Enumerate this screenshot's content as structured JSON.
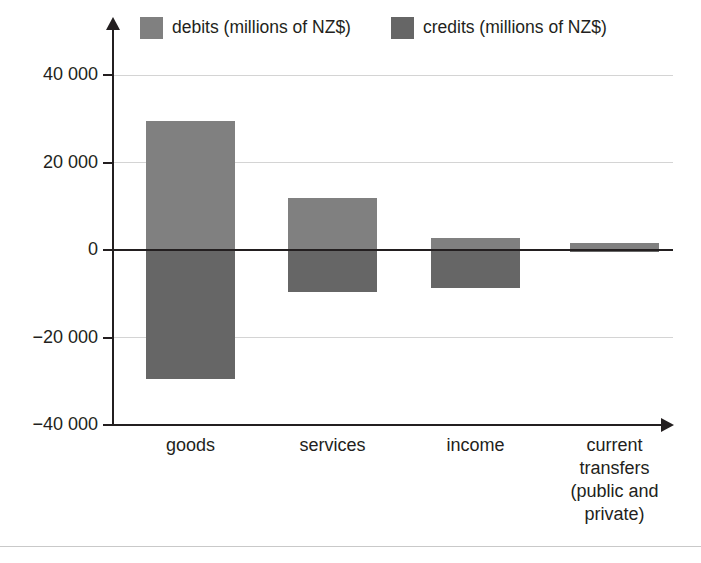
{
  "chart_data": {
    "type": "bar",
    "title": "",
    "subtitle": "",
    "xlabel": "",
    "ylabel": "",
    "ylim": [
      -40000,
      40000
    ],
    "grid": true,
    "legend_position": "top",
    "units": "millions of NZ$",
    "orientation": "vertical",
    "note": "Diverging bar chart: debits plotted above zero, credits plotted below zero.",
    "categories": [
      "goods",
      "services",
      "income",
      "current transfers (public and private)"
    ],
    "category_lines": [
      [
        "goods"
      ],
      [
        "services"
      ],
      [
        "income"
      ],
      [
        "current",
        "transfers",
        "(public and",
        "private)"
      ]
    ],
    "series": [
      {
        "name": "debits (millions of NZ$)",
        "color": "#808080",
        "values": [
          29500,
          12000,
          2700,
          1500
        ]
      },
      {
        "name": "credits (millions of NZ$)",
        "color": "#666666",
        "values": [
          -29500,
          -9500,
          -8700,
          -500
        ]
      }
    ],
    "yticks": [
      40000,
      20000,
      0,
      -20000,
      -40000
    ],
    "ytick_labels": [
      "40 000",
      "20 000",
      "0",
      "−20 000",
      "−40 000"
    ]
  },
  "legend": {
    "entries": [
      {
        "label": "debits (millions of NZ$)",
        "color": "#808080",
        "swatch_name": "debits-swatch"
      },
      {
        "label": "credits (millions of NZ$)",
        "color": "#666666",
        "swatch_name": "credits-swatch"
      }
    ]
  },
  "colors": {
    "debits": "#808080",
    "credits": "#666666",
    "axis": "#231f20",
    "gridline": "#d4d4d4",
    "background": "#ffffff",
    "bottom_rule": "#c9c9c9"
  }
}
